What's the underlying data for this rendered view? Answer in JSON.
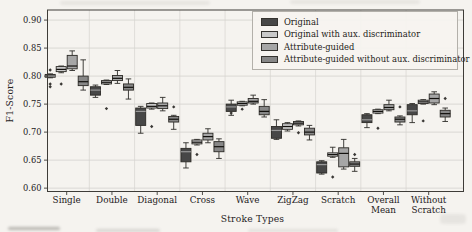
{
  "chart_data": {
    "type": "boxplot",
    "title": "",
    "xlabel": "Stroke Types",
    "ylabel": "F1-Score",
    "ylim": [
      0.594,
      0.918
    ],
    "yticks": [
      0.6,
      0.65,
      0.7,
      0.75,
      0.8,
      0.85,
      0.9
    ],
    "ytick_labels": [
      "0.60",
      "0.65",
      "0.70",
      "0.75",
      "0.80",
      "0.85",
      "0.90"
    ],
    "grid": true,
    "legend_position": "upper right inside plot",
    "categories": [
      "Single",
      "Double",
      "Diagonal",
      "Cross",
      "Wave",
      "ZigZag",
      "Scratch",
      "Overall\nMean",
      "Without\nScratch"
    ],
    "series": [
      {
        "name": "Original",
        "color": "#474747",
        "boxes": [
          {
            "whislo": 0.797,
            "q1": 0.798,
            "med": 0.8,
            "q3": 0.803,
            "whishi": 0.804,
            "fliers": [
              0.811,
              0.786,
              0.781
            ]
          },
          {
            "whislo": 0.762,
            "q1": 0.766,
            "med": 0.775,
            "q3": 0.781,
            "whishi": 0.784,
            "fliers": []
          },
          {
            "whislo": 0.698,
            "q1": 0.712,
            "med": 0.737,
            "q3": 0.743,
            "whishi": 0.746,
            "fliers": []
          },
          {
            "whislo": 0.636,
            "q1": 0.647,
            "med": 0.665,
            "q3": 0.671,
            "whishi": 0.681,
            "fliers": []
          },
          {
            "whislo": 0.73,
            "q1": 0.737,
            "med": 0.745,
            "q3": 0.75,
            "whishi": 0.757,
            "fliers": [
              0.734
            ]
          },
          {
            "whislo": 0.687,
            "q1": 0.689,
            "med": 0.703,
            "q3": 0.71,
            "whishi": 0.722,
            "fliers": []
          },
          {
            "whislo": 0.625,
            "q1": 0.627,
            "med": 0.642,
            "q3": 0.647,
            "whishi": 0.649,
            "fliers": []
          },
          {
            "whislo": 0.708,
            "q1": 0.717,
            "med": 0.722,
            "q3": 0.731,
            "whishi": 0.733,
            "fliers": []
          },
          {
            "whislo": 0.717,
            "q1": 0.731,
            "med": 0.738,
            "q3": 0.749,
            "whishi": 0.751,
            "fliers": []
          }
        ]
      },
      {
        "name": "Original with aux. discriminator",
        "color": "#c9c9c9",
        "boxes": [
          {
            "whislo": 0.806,
            "q1": 0.808,
            "med": 0.812,
            "q3": 0.817,
            "whishi": 0.818,
            "fliers": [
              0.786
            ]
          },
          {
            "whislo": 0.785,
            "q1": 0.786,
            "med": 0.789,
            "q3": 0.792,
            "whishi": 0.793,
            "fliers": [
              0.742
            ]
          },
          {
            "whislo": 0.741,
            "q1": 0.743,
            "med": 0.746,
            "q3": 0.751,
            "whishi": 0.752,
            "fliers": [
              0.71
            ]
          },
          {
            "whislo": 0.677,
            "q1": 0.679,
            "med": 0.682,
            "q3": 0.686,
            "whishi": 0.687,
            "fliers": [
              0.66
            ]
          },
          {
            "whislo": 0.747,
            "q1": 0.748,
            "med": 0.751,
            "q3": 0.754,
            "whishi": 0.755,
            "fliers": [
              0.741
            ]
          },
          {
            "whislo": 0.702,
            "q1": 0.705,
            "med": 0.71,
            "q3": 0.715,
            "whishi": 0.717,
            "fliers": []
          },
          {
            "whislo": 0.655,
            "q1": 0.657,
            "med": 0.66,
            "q3": 0.663,
            "whishi": 0.673,
            "fliers": [
              0.62
            ]
          },
          {
            "whislo": 0.733,
            "q1": 0.734,
            "med": 0.737,
            "q3": 0.74,
            "whishi": 0.741,
            "fliers": [
              0.707
            ]
          },
          {
            "whislo": 0.75,
            "q1": 0.751,
            "med": 0.754,
            "q3": 0.757,
            "whishi": 0.758,
            "fliers": [
              0.72
            ]
          }
        ]
      },
      {
        "name": "Attribute-guided",
        "color": "#a6a6a6",
        "boxes": [
          {
            "whislo": 0.81,
            "q1": 0.813,
            "med": 0.818,
            "q3": 0.837,
            "whishi": 0.845,
            "fliers": []
          },
          {
            "whislo": 0.787,
            "q1": 0.792,
            "med": 0.796,
            "q3": 0.801,
            "whishi": 0.81,
            "fliers": []
          },
          {
            "whislo": 0.738,
            "q1": 0.742,
            "med": 0.747,
            "q3": 0.752,
            "whishi": 0.762,
            "fliers": []
          },
          {
            "whislo": 0.681,
            "q1": 0.686,
            "med": 0.692,
            "q3": 0.698,
            "whishi": 0.706,
            "fliers": []
          },
          {
            "whislo": 0.75,
            "q1": 0.752,
            "med": 0.755,
            "q3": 0.76,
            "whishi": 0.766,
            "fliers": []
          },
          {
            "whislo": 0.711,
            "q1": 0.713,
            "med": 0.716,
            "q3": 0.719,
            "whishi": 0.72,
            "fliers": [
              0.699
            ]
          },
          {
            "whislo": 0.634,
            "q1": 0.638,
            "med": 0.662,
            "q3": 0.672,
            "whishi": 0.687,
            "fliers": []
          },
          {
            "whislo": 0.738,
            "q1": 0.74,
            "med": 0.744,
            "q3": 0.749,
            "whishi": 0.757,
            "fliers": []
          },
          {
            "whislo": 0.749,
            "q1": 0.752,
            "med": 0.76,
            "q3": 0.768,
            "whishi": 0.772,
            "fliers": []
          }
        ]
      },
      {
        "name": "Attribute-guided without aux. discriminator",
        "color": "#878787",
        "boxes": [
          {
            "whislo": 0.775,
            "q1": 0.783,
            "med": 0.79,
            "q3": 0.8,
            "whishi": 0.829,
            "fliers": []
          },
          {
            "whislo": 0.759,
            "q1": 0.775,
            "med": 0.78,
            "q3": 0.786,
            "whishi": 0.795,
            "fliers": []
          },
          {
            "whislo": 0.705,
            "q1": 0.718,
            "med": 0.723,
            "q3": 0.728,
            "whishi": 0.73,
            "fliers": [
              0.745
            ]
          },
          {
            "whislo": 0.653,
            "q1": 0.665,
            "med": 0.674,
            "q3": 0.683,
            "whishi": 0.688,
            "fliers": []
          },
          {
            "whislo": 0.727,
            "q1": 0.731,
            "med": 0.737,
            "q3": 0.746,
            "whishi": 0.758,
            "fliers": []
          },
          {
            "whislo": 0.686,
            "q1": 0.695,
            "med": 0.7,
            "q3": 0.707,
            "whishi": 0.712,
            "fliers": []
          },
          {
            "whislo": 0.63,
            "q1": 0.639,
            "med": 0.643,
            "q3": 0.647,
            "whishi": 0.653,
            "fliers": [
              0.66
            ]
          },
          {
            "whislo": 0.713,
            "q1": 0.718,
            "med": 0.723,
            "q3": 0.727,
            "whishi": 0.729,
            "fliers": [
              0.745
            ]
          },
          {
            "whislo": 0.719,
            "q1": 0.727,
            "med": 0.733,
            "q3": 0.739,
            "whishi": 0.743,
            "fliers": [
              0.76
            ]
          }
        ]
      }
    ]
  }
}
